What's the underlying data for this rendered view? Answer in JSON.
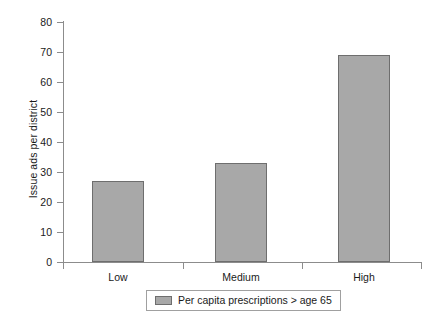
{
  "chart_data": {
    "type": "bar",
    "title": "",
    "subtitle": "",
    "xlabel": "",
    "ylabel": "Issue ads per district",
    "categories": [
      "Low",
      "Medium",
      "High"
    ],
    "values": [
      27,
      33,
      69
    ],
    "series": [
      {
        "name": "Per capita prescriptions > age 65",
        "values": [
          27,
          33,
          69
        ],
        "color": "#a8a8a8"
      }
    ],
    "ylim": [
      0,
      80
    ],
    "yticks": [
      0,
      10,
      20,
      30,
      40,
      50,
      60,
      70,
      80
    ],
    "ytick_labels": [
      "0",
      "10",
      "20",
      "30",
      "40",
      "50",
      "60",
      "70",
      "80"
    ],
    "grid": false,
    "legend_position": "bottom-center"
  },
  "axes": {
    "y_title": "Issue ads per district",
    "y_tick_labels": [
      "80",
      "70",
      "60",
      "50",
      "40",
      "30",
      "20",
      "10",
      "0"
    ],
    "x_tick_labels": [
      "Low",
      "Medium",
      "High"
    ]
  },
  "legend": {
    "entries": [
      {
        "label": "Per capita prescriptions > age 65",
        "swatch_color": "#a8a8a8"
      }
    ]
  },
  "colors": {
    "bar_fill": "#a8a8a8",
    "bar_border": "#6e6e6e",
    "axis": "#8c8c8c",
    "text": "#1a1a1a",
    "background": "#ffffff"
  }
}
